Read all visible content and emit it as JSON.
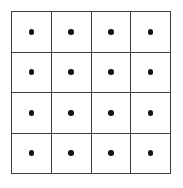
{
  "figure": {
    "canvas": {
      "width": 183,
      "height": 188,
      "background_color": "#ffffff"
    },
    "grid": {
      "rows": 4,
      "columns": 4,
      "cell_count": 16,
      "line_color": "#3f3f3f",
      "line_width_px": 1.6,
      "cell_background_color": "#ffffff",
      "origin_x": 11,
      "origin_y": 11,
      "width": 160,
      "height": 163
    },
    "marker": {
      "shape": "circle",
      "fill_color": "#141414",
      "diameter_px": 5.6,
      "placement": "center",
      "count_per_cell": 1,
      "total_count": 16
    },
    "cells": [
      {
        "row": 1,
        "column": 1,
        "dot_label": "dot",
        "dots": 1
      },
      {
        "row": 1,
        "column": 2,
        "dot_label": "dot",
        "dots": 1
      },
      {
        "row": 1,
        "column": 3,
        "dot_label": "dot",
        "dots": 1
      },
      {
        "row": 1,
        "column": 4,
        "dot_label": "dot",
        "dots": 1
      },
      {
        "row": 2,
        "column": 1,
        "dot_label": "dot",
        "dots": 1
      },
      {
        "row": 2,
        "column": 2,
        "dot_label": "dot",
        "dots": 1
      },
      {
        "row": 2,
        "column": 3,
        "dot_label": "dot",
        "dots": 1
      },
      {
        "row": 2,
        "column": 4,
        "dot_label": "dot",
        "dots": 1
      },
      {
        "row": 3,
        "column": 1,
        "dot_label": "dot",
        "dots": 1
      },
      {
        "row": 3,
        "column": 2,
        "dot_label": "dot",
        "dots": 1
      },
      {
        "row": 3,
        "column": 3,
        "dot_label": "dot",
        "dots": 1
      },
      {
        "row": 3,
        "column": 4,
        "dot_label": "dot",
        "dots": 1
      },
      {
        "row": 4,
        "column": 1,
        "dot_label": "dot",
        "dots": 1
      },
      {
        "row": 4,
        "column": 2,
        "dot_label": "dot",
        "dots": 1
      },
      {
        "row": 4,
        "column": 3,
        "dot_label": "dot",
        "dots": 1
      },
      {
        "row": 4,
        "column": 4,
        "dot_label": "dot",
        "dots": 1
      }
    ]
  }
}
